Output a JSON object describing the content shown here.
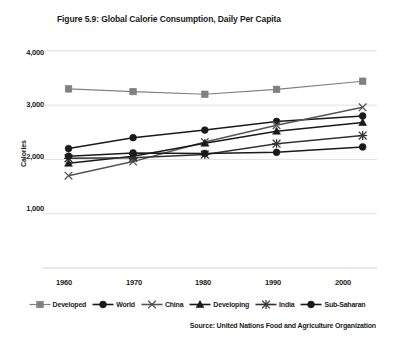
{
  "chart_data": {
    "type": "line",
    "title": "Figure 5.9: Global Calorie Consumption, Daily Per Capita",
    "xlabel": "",
    "ylabel": "Calories",
    "source": "Source: United Nations Food and Agriculture Organization",
    "x": [
      1961,
      1970,
      1980,
      1990,
      2002
    ],
    "xtick_labels": [
      "1960",
      "1970",
      "1980",
      "1990",
      "2000"
    ],
    "xtick_values": [
      1960,
      1970,
      1980,
      1990,
      2000
    ],
    "ytick_labels": [
      "1,000",
      "2,000",
      "3,000",
      "4,000"
    ],
    "ytick_values": [
      1000,
      2000,
      3000,
      4000
    ],
    "ylim": [
      0,
      4200
    ],
    "xlim": [
      1958,
      2004
    ],
    "grid": true,
    "legend_position": "bottom",
    "series": [
      {
        "name": "Developed",
        "marker": "square",
        "color": "#808080",
        "values": [
          3300,
          3250,
          3200,
          3290,
          3440
        ]
      },
      {
        "name": "World",
        "marker": "circle",
        "color": "#1a1a1a",
        "values": [
          2200,
          2400,
          2540,
          2700,
          2800
        ]
      },
      {
        "name": "China",
        "marker": "x",
        "color": "#555555",
        "values": [
          1700,
          1960,
          2320,
          2630,
          2960
        ]
      },
      {
        "name": "Developing",
        "marker": "triangle",
        "color": "#1a1a1a",
        "values": [
          1930,
          2060,
          2300,
          2520,
          2680
        ]
      },
      {
        "name": "India",
        "marker": "asterisk",
        "color": "#333333",
        "values": [
          2020,
          2030,
          2090,
          2290,
          2440
        ]
      },
      {
        "name": "Sub-Saharan",
        "marker": "circle",
        "color": "#1a1a1a",
        "values": [
          2060,
          2120,
          2110,
          2130,
          2230
        ]
      }
    ]
  }
}
